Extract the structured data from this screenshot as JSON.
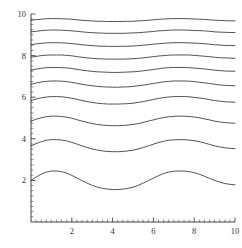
{
  "chart_data": {
    "type": "line",
    "title": "",
    "subtitle": "",
    "xlabel": "",
    "ylabel": "",
    "xlim": [
      0,
      10
    ],
    "ylim": [
      0,
      10
    ],
    "grid": false,
    "legend": false,
    "legend_position": "none",
    "x_ticks_major": [
      2,
      4,
      6,
      8,
      10
    ],
    "x_tick_labels": [
      "2",
      "4",
      "6",
      "8",
      "10"
    ],
    "x_ticks_minor": [
      0.25,
      0.5,
      0.75,
      1,
      1.25,
      1.5,
      1.75,
      2.25,
      2.5,
      2.75,
      3,
      3.25,
      3.5,
      3.75,
      4.25,
      4.5,
      4.75,
      5,
      5.25,
      5.5,
      5.75,
      6.25,
      6.5,
      6.75,
      7,
      7.25,
      7.5,
      7.75,
      8.25,
      8.5,
      8.75,
      9,
      9.25,
      9.5,
      9.75
    ],
    "y_ticks_major": [
      2,
      4,
      6,
      8,
      10
    ],
    "y_tick_labels": [
      "2",
      "4",
      "6",
      "8",
      "10"
    ],
    "y_ticks_minor": [
      0.25,
      0.5,
      0.75,
      1,
      1.25,
      1.5,
      1.75,
      2.25,
      2.5,
      2.75,
      3,
      3.25,
      3.5,
      3.75,
      4.25,
      4.5,
      4.75,
      5,
      5.25,
      5.5,
      5.75,
      6.25,
      6.5,
      6.75,
      7,
      7.25,
      7.5,
      7.75,
      8.25,
      8.5,
      8.75,
      9,
      9.25,
      9.5,
      9.75
    ],
    "line_color": "#333333",
    "line_width": 0.85,
    "x": [
      0,
      0.25,
      0.5,
      0.75,
      1,
      1.25,
      1.5,
      1.75,
      2,
      2.25,
      2.5,
      2.75,
      3,
      3.25,
      3.5,
      3.75,
      4,
      4.25,
      4.5,
      4.75,
      5,
      5.25,
      5.5,
      5.75,
      6,
      6.25,
      6.5,
      6.75,
      7,
      7.25,
      7.5,
      7.75,
      8,
      8.25,
      8.5,
      8.75,
      9,
      9.25,
      9.5,
      9.75,
      10
    ],
    "series": [
      {
        "name": "curve-1",
        "baseline": 2.0,
        "amplitude": 0.45,
        "values": [
          2.0,
          2.16,
          2.3,
          2.4,
          2.45,
          2.45,
          2.42,
          2.35,
          2.24,
          2.12,
          1.99,
          1.87,
          1.76,
          1.68,
          1.62,
          1.58,
          1.56,
          1.56,
          1.58,
          1.62,
          1.67,
          1.76,
          1.87,
          1.99,
          2.11,
          2.23,
          2.33,
          2.4,
          2.44,
          2.45,
          2.45,
          2.42,
          2.37,
          2.3,
          2.2,
          2.1,
          2.0,
          1.92,
          1.85,
          1.81,
          1.79
        ]
      },
      {
        "name": "curve-2",
        "baseline": 3.66,
        "amplitude": 0.3,
        "values": [
          3.66,
          3.77,
          3.86,
          3.93,
          3.96,
          3.96,
          3.94,
          3.9,
          3.83,
          3.75,
          3.66,
          3.58,
          3.51,
          3.46,
          3.42,
          3.39,
          3.38,
          3.38,
          3.39,
          3.42,
          3.45,
          3.51,
          3.58,
          3.66,
          3.74,
          3.82,
          3.88,
          3.93,
          3.95,
          3.96,
          3.96,
          3.94,
          3.91,
          3.86,
          3.8,
          3.73,
          3.66,
          3.61,
          3.57,
          3.54,
          3.53
        ]
      },
      {
        "name": "curve-3",
        "baseline": 4.85,
        "amplitude": 0.24,
        "values": [
          4.85,
          4.94,
          5.01,
          5.06,
          5.09,
          5.09,
          5.07,
          5.04,
          4.99,
          4.92,
          4.85,
          4.79,
          4.73,
          4.69,
          4.66,
          4.64,
          4.63,
          4.63,
          4.64,
          4.66,
          4.69,
          4.73,
          4.79,
          4.85,
          4.91,
          4.97,
          5.02,
          5.06,
          5.08,
          5.09,
          5.09,
          5.07,
          5.05,
          5.01,
          4.96,
          4.91,
          4.85,
          4.81,
          4.78,
          4.76,
          4.75
        ]
      },
      {
        "name": "curve-4",
        "baseline": 5.84,
        "amplitude": 0.19,
        "values": [
          5.84,
          5.91,
          5.97,
          6.01,
          6.03,
          6.03,
          6.02,
          5.99,
          5.95,
          5.9,
          5.84,
          5.79,
          5.75,
          5.71,
          5.69,
          5.67,
          5.67,
          5.67,
          5.68,
          5.69,
          5.71,
          5.75,
          5.79,
          5.84,
          5.89,
          5.94,
          5.98,
          6.01,
          6.03,
          6.03,
          6.03,
          6.02,
          5.99,
          5.96,
          5.93,
          5.88,
          5.84,
          5.81,
          5.78,
          5.77,
          5.76
        ]
      },
      {
        "name": "curve-5",
        "baseline": 6.62,
        "amplitude": 0.16,
        "values": [
          6.62,
          6.68,
          6.73,
          6.76,
          6.78,
          6.78,
          6.77,
          6.75,
          6.71,
          6.67,
          6.62,
          6.58,
          6.55,
          6.52,
          6.5,
          6.49,
          6.48,
          6.48,
          6.49,
          6.5,
          6.52,
          6.55,
          6.58,
          6.62,
          6.66,
          6.7,
          6.74,
          6.76,
          6.78,
          6.78,
          6.78,
          6.77,
          6.75,
          6.72,
          6.69,
          6.66,
          6.62,
          6.59,
          6.57,
          6.56,
          6.55
        ]
      },
      {
        "name": "curve-6",
        "baseline": 7.3,
        "amplitude": 0.13,
        "values": [
          7.3,
          7.35,
          7.39,
          7.42,
          7.43,
          7.43,
          7.42,
          7.41,
          7.38,
          7.34,
          7.3,
          7.27,
          7.24,
          7.22,
          7.21,
          7.2,
          7.19,
          7.19,
          7.2,
          7.21,
          7.22,
          7.24,
          7.27,
          7.3,
          7.33,
          7.37,
          7.4,
          7.42,
          7.43,
          7.43,
          7.43,
          7.42,
          7.4,
          7.38,
          7.36,
          7.33,
          7.3,
          7.28,
          7.26,
          7.25,
          7.25
        ]
      },
      {
        "name": "curve-7",
        "baseline": 7.92,
        "amplitude": 0.115,
        "values": [
          7.92,
          7.96,
          8.0,
          8.02,
          8.03,
          8.03,
          8.03,
          8.01,
          7.99,
          7.95,
          7.92,
          7.89,
          7.87,
          7.85,
          7.84,
          7.83,
          7.83,
          7.83,
          7.83,
          7.84,
          7.85,
          7.87,
          7.89,
          7.92,
          7.95,
          7.98,
          8.0,
          8.02,
          8.03,
          8.03,
          8.03,
          8.03,
          8.01,
          7.99,
          7.97,
          7.95,
          7.92,
          7.9,
          7.89,
          7.88,
          7.87
        ]
      },
      {
        "name": "curve-8",
        "baseline": 8.52,
        "amplitude": 0.1,
        "values": [
          8.52,
          8.56,
          8.59,
          8.61,
          8.62,
          8.62,
          8.61,
          8.6,
          8.58,
          8.55,
          8.52,
          8.5,
          8.48,
          8.46,
          8.45,
          8.45,
          8.44,
          8.44,
          8.45,
          8.45,
          8.46,
          8.48,
          8.5,
          8.52,
          8.55,
          8.57,
          8.59,
          8.61,
          8.62,
          8.62,
          8.62,
          8.61,
          8.6,
          8.59,
          8.57,
          8.55,
          8.52,
          8.51,
          8.49,
          8.49,
          8.48
        ]
      },
      {
        "name": "curve-9",
        "baseline": 9.14,
        "amplitude": 0.09,
        "values": [
          9.14,
          9.17,
          9.2,
          9.22,
          9.23,
          9.23,
          9.22,
          9.21,
          9.19,
          9.17,
          9.14,
          9.12,
          9.1,
          9.09,
          9.08,
          9.07,
          9.07,
          9.07,
          9.07,
          9.08,
          9.09,
          9.1,
          9.12,
          9.14,
          9.16,
          9.19,
          9.2,
          9.22,
          9.23,
          9.23,
          9.23,
          9.22,
          9.21,
          9.2,
          9.19,
          9.17,
          9.14,
          9.13,
          9.12,
          9.11,
          9.11
        ]
      },
      {
        "name": "curve-10",
        "baseline": 9.7,
        "amplitude": 0.08,
        "values": [
          9.7,
          9.73,
          9.75,
          9.77,
          9.78,
          9.78,
          9.77,
          9.76,
          9.75,
          9.72,
          9.7,
          9.68,
          9.67,
          9.65,
          9.65,
          9.64,
          9.64,
          9.64,
          9.64,
          9.65,
          9.65,
          9.67,
          9.68,
          9.7,
          9.72,
          9.74,
          9.76,
          9.77,
          9.78,
          9.78,
          9.78,
          9.77,
          9.76,
          9.75,
          9.74,
          9.72,
          9.7,
          9.69,
          9.68,
          9.67,
          9.67
        ]
      }
    ]
  }
}
